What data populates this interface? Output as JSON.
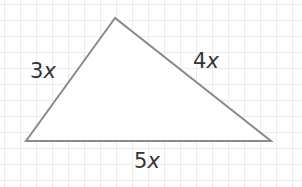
{
  "diagram": {
    "type": "triangle",
    "vertices": {
      "top": [
        115,
        18
      ],
      "bottom_left": [
        26,
        141
      ],
      "bottom_right": [
        271,
        141
      ]
    },
    "points": "115,18 26,141 271,141",
    "stroke_color": "#8a8a8a",
    "fill_color": "#ffffff",
    "grid_color": "#ececec",
    "sides": [
      {
        "name": "left",
        "coefficient": "3",
        "variable": "x"
      },
      {
        "name": "right",
        "coefficient": "4",
        "variable": "x"
      },
      {
        "name": "bottom",
        "coefficient": "5",
        "variable": "x"
      }
    ]
  }
}
